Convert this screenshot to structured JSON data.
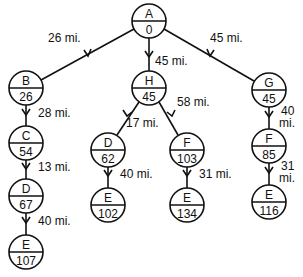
{
  "diagram": {
    "type": "search-tree",
    "nodes": [
      {
        "id": "A",
        "name": "A",
        "value": "0",
        "x": 149,
        "y": 21
      },
      {
        "id": "B",
        "name": "B",
        "value": "26",
        "x": 26,
        "y": 88
      },
      {
        "id": "H",
        "name": "H",
        "value": "45",
        "x": 149,
        "y": 88
      },
      {
        "id": "G",
        "name": "G",
        "value": "45",
        "x": 269,
        "y": 90
      },
      {
        "id": "C",
        "name": "C",
        "value": "54",
        "x": 26,
        "y": 143
      },
      {
        "id": "D1",
        "name": "D",
        "value": "67",
        "x": 26,
        "y": 196
      },
      {
        "id": "E1",
        "name": "E",
        "value": "107",
        "x": 26,
        "y": 252
      },
      {
        "id": "D2",
        "name": "D",
        "value": "62",
        "x": 108,
        "y": 150
      },
      {
        "id": "F2",
        "name": "F",
        "value": "103",
        "x": 187,
        "y": 150
      },
      {
        "id": "E2",
        "name": "E",
        "value": "102",
        "x": 108,
        "y": 205
      },
      {
        "id": "E3",
        "name": "E",
        "value": "134",
        "x": 187,
        "y": 205
      },
      {
        "id": "F3",
        "name": "F",
        "value": "85",
        "x": 269,
        "y": 146
      },
      {
        "id": "E4",
        "name": "E",
        "value": "116",
        "x": 269,
        "y": 202
      }
    ],
    "edges": [
      {
        "from": "A",
        "to": "B",
        "label": "26 mi."
      },
      {
        "from": "A",
        "to": "H",
        "label": "45 mi."
      },
      {
        "from": "A",
        "to": "G",
        "label": "45 mi."
      },
      {
        "from": "B",
        "to": "C",
        "label": "28 mi."
      },
      {
        "from": "C",
        "to": "D1",
        "label": "13 mi."
      },
      {
        "from": "D1",
        "to": "E1",
        "label": "40 mi."
      },
      {
        "from": "H",
        "to": "D2",
        "label": "17 mi."
      },
      {
        "from": "H",
        "to": "F2",
        "label": "58 mi."
      },
      {
        "from": "D2",
        "to": "E2",
        "label": "40 mi."
      },
      {
        "from": "F2",
        "to": "E3",
        "label": "31 mi."
      },
      {
        "from": "G",
        "to": "F3",
        "label": "40 mi."
      },
      {
        "from": "F3",
        "to": "E4",
        "label": "31 mi."
      }
    ]
  },
  "labels": {
    "AB": "26 mi.",
    "AH": "45 mi.",
    "AG": "45 mi.",
    "BC": "28 mi.",
    "CD": "13 mi.",
    "DE1": "40 mi.",
    "HD": "17 mi.",
    "HF": "58 mi.",
    "DE2": "40 mi.",
    "FE3": "31 mi.",
    "GF_1": "40",
    "GF_2": "mi.",
    "FE4_1": "31",
    "FE4_2": "mi."
  },
  "nodes": {
    "A": {
      "name": "A",
      "value": "0"
    },
    "B": {
      "name": "B",
      "value": "26"
    },
    "H": {
      "name": "H",
      "value": "45"
    },
    "G": {
      "name": "G",
      "value": "45"
    },
    "C": {
      "name": "C",
      "value": "54"
    },
    "D1": {
      "name": "D",
      "value": "67"
    },
    "E1": {
      "name": "E",
      "value": "107"
    },
    "D2": {
      "name": "D",
      "value": "62"
    },
    "F2": {
      "name": "F",
      "value": "103"
    },
    "E2": {
      "name": "E",
      "value": "102"
    },
    "E3": {
      "name": "E",
      "value": "134"
    },
    "F3": {
      "name": "F",
      "value": "85"
    },
    "E4": {
      "name": "E",
      "value": "116"
    }
  }
}
